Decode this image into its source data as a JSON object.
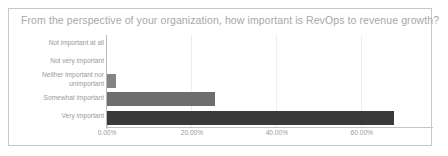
{
  "card": {
    "border_color": "#c8c8c8",
    "background": "#ffffff"
  },
  "chart_data": {
    "type": "bar",
    "orientation": "horizontal",
    "title": "From the perspective of your organization, how important is RevOps to revenue growth?",
    "xlabel": "",
    "ylabel": "",
    "categories": [
      "Not important at all",
      "Not very important",
      "Neither important nor unimportant",
      "Somewhat important",
      "Very important"
    ],
    "values": [
      0,
      0,
      2.1,
      25.4,
      67.5
    ],
    "value_labels": [
      "0.00%",
      "0.00%",
      "2.10%",
      "25.40%",
      "67.50%"
    ],
    "bar_colors": [
      "#7f7f7f",
      "#7f7f7f",
      "#848484",
      "#6e6e6e",
      "#3a3a3a"
    ],
    "xlim": [
      0,
      77
    ],
    "xticks": [
      0,
      20,
      40,
      60
    ],
    "xtick_labels": [
      "0.00%",
      "20.00%",
      "40.00%",
      "60.00%"
    ],
    "grid": true,
    "grid_color": "#eeeeee",
    "axis_color": "#b9b9b9",
    "legend": null,
    "title_color": "#a8a8a8",
    "tick_label_color": "#9a9a9a"
  }
}
